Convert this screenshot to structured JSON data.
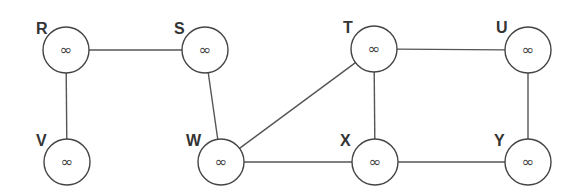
{
  "graph": {
    "title": "",
    "nodes": [
      {
        "id": "R",
        "label": "R",
        "value": "∞",
        "cx": 66,
        "cy": 50,
        "lx": 36,
        "ly": 34
      },
      {
        "id": "S",
        "label": "S",
        "value": "∞",
        "cx": 205,
        "cy": 50,
        "lx": 174,
        "ly": 34
      },
      {
        "id": "T",
        "label": "T",
        "value": "∞",
        "cx": 374,
        "cy": 49,
        "lx": 343,
        "ly": 33
      },
      {
        "id": "U",
        "label": "U",
        "value": "∞",
        "cx": 528,
        "cy": 50,
        "lx": 496,
        "ly": 33
      },
      {
        "id": "V",
        "label": "V",
        "value": "∞",
        "cx": 67,
        "cy": 162,
        "lx": 36,
        "ly": 146
      },
      {
        "id": "W",
        "label": "W",
        "value": "∞",
        "cx": 221,
        "cy": 162,
        "lx": 186,
        "ly": 146
      },
      {
        "id": "X",
        "label": "X",
        "value": "∞",
        "cx": 375,
        "cy": 162,
        "lx": 340,
        "ly": 146
      },
      {
        "id": "Y",
        "label": "Y",
        "value": "∞",
        "cx": 528,
        "cy": 162,
        "lx": 494,
        "ly": 146
      }
    ],
    "edges": [
      {
        "from": "R",
        "to": "S"
      },
      {
        "from": "R",
        "to": "V"
      },
      {
        "from": "S",
        "to": "W"
      },
      {
        "from": "W",
        "to": "T"
      },
      {
        "from": "W",
        "to": "X"
      },
      {
        "from": "T",
        "to": "U"
      },
      {
        "from": "T",
        "to": "X"
      },
      {
        "from": "U",
        "to": "Y"
      },
      {
        "from": "X",
        "to": "Y"
      }
    ],
    "node_radius": 23,
    "colors": {
      "stroke": "#444444",
      "edge": "#555555",
      "label": "#333333",
      "background": "#ffffff"
    }
  }
}
